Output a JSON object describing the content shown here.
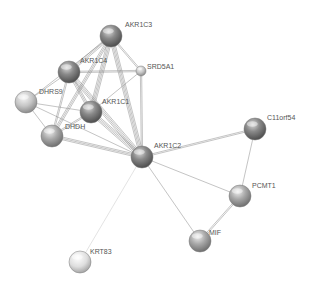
{
  "diagram": {
    "type": "protein-interaction-network",
    "nodes": [
      {
        "id": "AKR1C3",
        "label": "AKR1C3",
        "x": 111,
        "y": 36,
        "r": 11,
        "shade": "dark",
        "label_dx": 14,
        "label_dy": -12
      },
      {
        "id": "AKR1C4",
        "label": "AKR1C4",
        "x": 69,
        "y": 72,
        "r": 11,
        "shade": "dark",
        "label_dx": 11,
        "label_dy": -12
      },
      {
        "id": "SRD5A1",
        "label": "SRD5A1",
        "x": 141,
        "y": 71,
        "r": 5,
        "shade": "light",
        "label_dx": 6,
        "label_dy": -5
      },
      {
        "id": "DHRS9",
        "label": "DHRS9",
        "x": 26,
        "y": 102,
        "r": 11,
        "shade": "light",
        "label_dx": 13,
        "label_dy": -11
      },
      {
        "id": "AKR1C1",
        "label": "AKR1C1",
        "x": 91,
        "y": 112,
        "r": 11,
        "shade": "dark",
        "label_dx": 11,
        "label_dy": -11
      },
      {
        "id": "DHDH",
        "label": "DHDH",
        "x": 52,
        "y": 136,
        "r": 11,
        "shade": "mid",
        "label_dx": 13,
        "label_dy": -10
      },
      {
        "id": "AKR1C2",
        "label": "AKR1C2",
        "x": 142,
        "y": 157,
        "r": 11,
        "shade": "dark",
        "label_dx": 12,
        "label_dy": -12
      },
      {
        "id": "C11orf54",
        "label": "C11orf54",
        "x": 255,
        "y": 129,
        "r": 11,
        "shade": "dark",
        "label_dx": 12,
        "label_dy": -12
      },
      {
        "id": "PCMT1",
        "label": "PCMT1",
        "x": 240,
        "y": 196,
        "r": 11,
        "shade": "mid",
        "label_dx": 12,
        "label_dy": -11
      },
      {
        "id": "MIF",
        "label": "MIF",
        "x": 200,
        "y": 241,
        "r": 11,
        "shade": "mid",
        "label_dx": 9,
        "label_dy": -9
      },
      {
        "id": "KRT83",
        "label": "KRT83",
        "x": 80,
        "y": 262,
        "r": 11,
        "shade": "pale",
        "label_dx": 10,
        "label_dy": -11
      }
    ],
    "edges": [
      {
        "from": "AKR1C3",
        "to": "AKR1C4",
        "weight": 3
      },
      {
        "from": "AKR1C3",
        "to": "SRD5A1",
        "weight": 2
      },
      {
        "from": "AKR1C3",
        "to": "AKR1C1",
        "weight": 4
      },
      {
        "from": "AKR1C3",
        "to": "AKR1C2",
        "weight": 4
      },
      {
        "from": "AKR1C3",
        "to": "DHDH",
        "weight": 3
      },
      {
        "from": "AKR1C3",
        "to": "DHRS9",
        "weight": 1
      },
      {
        "from": "AKR1C4",
        "to": "SRD5A1",
        "weight": 2
      },
      {
        "from": "AKR1C4",
        "to": "AKR1C1",
        "weight": 3
      },
      {
        "from": "AKR1C4",
        "to": "AKR1C2",
        "weight": 4
      },
      {
        "from": "AKR1C4",
        "to": "DHDH",
        "weight": 2
      },
      {
        "from": "AKR1C4",
        "to": "DHRS9",
        "weight": 1
      },
      {
        "from": "SRD5A1",
        "to": "AKR1C1",
        "weight": 1
      },
      {
        "from": "SRD5A1",
        "to": "AKR1C2",
        "weight": 2
      },
      {
        "from": "DHRS9",
        "to": "DHDH",
        "weight": 1
      },
      {
        "from": "DHRS9",
        "to": "AKR1C2",
        "weight": 1
      },
      {
        "from": "DHRS9",
        "to": "AKR1C1",
        "weight": 1
      },
      {
        "from": "AKR1C1",
        "to": "AKR1C2",
        "weight": 4
      },
      {
        "from": "AKR1C1",
        "to": "DHDH",
        "weight": 2
      },
      {
        "from": "DHDH",
        "to": "AKR1C2",
        "weight": 3
      },
      {
        "from": "AKR1C2",
        "to": "C11orf54",
        "weight": 2
      },
      {
        "from": "AKR1C2",
        "to": "PCMT1",
        "weight": 1
      },
      {
        "from": "AKR1C2",
        "to": "MIF",
        "weight": 1
      },
      {
        "from": "AKR1C2",
        "to": "KRT83",
        "weight": 1,
        "faint": true
      },
      {
        "from": "C11orf54",
        "to": "PCMT1",
        "weight": 1
      },
      {
        "from": "PCMT1",
        "to": "MIF",
        "weight": 2
      }
    ],
    "colors": {
      "background": "#ffffff",
      "edge": "#8a8a8a",
      "edge_faint": "#d0d0d0",
      "label": "#555555",
      "node_dark": "#6e6e6e",
      "node_mid": "#9a9a9a",
      "node_light": "#bdbdbd",
      "node_pale": "#d6d6d6"
    }
  }
}
